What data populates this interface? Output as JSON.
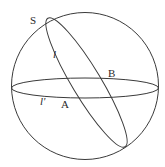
{
  "diagram": {
    "type": "sphere-with-great-circles",
    "stroke_color": "#3a3a3a",
    "background": "#ffffff",
    "elements": {
      "sphere": "outer circle (sphere outline)",
      "equator": "horizontal great circle l'",
      "tilted_circle": "tilted great circle l through S"
    },
    "labels": {
      "S": "S",
      "l": "l",
      "B": "B",
      "l_prime": "l'",
      "A": "A"
    }
  }
}
